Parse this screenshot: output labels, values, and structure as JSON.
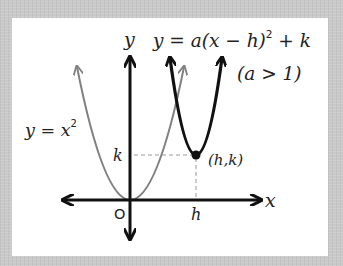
{
  "figure": {
    "background_color": "#c9c9c9",
    "panel_color": "#ffffff",
    "axes": {
      "x_label": "x",
      "y_label": "y",
      "origin_label": "O"
    },
    "curves": [
      {
        "name": "parent",
        "equation_label": "y = x",
        "exponent": "2",
        "color": "#808080"
      },
      {
        "name": "transformed",
        "equation_label": "y = a(x − h)",
        "exponent": "2",
        "equation_tail": " + k",
        "condition": "(a > 1)",
        "color": "#111111"
      }
    ],
    "vertex": {
      "label": "(h,k)",
      "x_label": "h",
      "y_label": "k"
    }
  }
}
